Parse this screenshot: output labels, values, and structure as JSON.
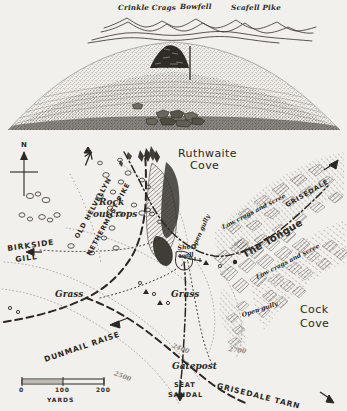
{
  "sheet": {
    "kind": "hand-drawn-fell-map-page",
    "paper_color": "#f2f0ec",
    "ink_color": "#2b2824",
    "contour_ink": "#9b978f"
  },
  "panorama": {
    "caption_row": [
      "Crinkle Crags",
      "Bowfell",
      "Scafell Pike"
    ],
    "summits": [
      {
        "label": "Crinkle Crags",
        "x": 123,
        "y": 9
      },
      {
        "label": "Bowfell",
        "x": 181,
        "y": 8
      },
      {
        "label": "Scafell Pike",
        "x": 232,
        "y": 9
      }
    ],
    "features": [
      "cairn",
      "iron-post",
      "stony-summit-slope",
      "distant-skyline"
    ]
  },
  "map": {
    "compass": {
      "label": "N",
      "x": 22,
      "y": 148
    },
    "scale_bar": {
      "ticks": [
        "0",
        "100",
        "200"
      ],
      "unit": "YARDS",
      "x": 22,
      "y": 378,
      "width": 82
    },
    "places": [
      {
        "name": "Ruthwaite Cove",
        "line1": "Ruthwaite",
        "line2": "Cove",
        "x": 180,
        "y": 148,
        "style": "place-big"
      },
      {
        "name": "Cock Cove",
        "line1": "Cock",
        "line2": "Cove",
        "x": 300,
        "y": 306,
        "style": "place-big"
      },
      {
        "name": "Rock outcrops",
        "line1": "Rock",
        "line2": "outcrops",
        "x": 98,
        "y": 199,
        "style": "place-mid"
      },
      {
        "name": "Grass left",
        "line1": "Grass",
        "x": 57,
        "y": 292,
        "style": "place-mid"
      },
      {
        "name": "Grass right",
        "line1": "Grass",
        "x": 172,
        "y": 292,
        "style": "place-mid"
      },
      {
        "name": "Gatepost",
        "line1": "Gatepost",
        "x": 175,
        "y": 364,
        "style": "place-mid"
      }
    ],
    "annotations": [
      {
        "name": "open-gully-upper",
        "label": "Open gully",
        "x": 197,
        "y": 232,
        "rot": "rot-gully1"
      },
      {
        "name": "open-gully-lower",
        "label": "Open gully",
        "x": 243,
        "y": 308,
        "rot": "rot-gully2"
      },
      {
        "name": "low-crags-scree-upper",
        "label": "Low crags and scree",
        "x": 225,
        "y": 219,
        "rot": "rot-lcs1"
      },
      {
        "name": "low-crags-scree-lower",
        "label": "Low crags and scree",
        "x": 258,
        "y": 268,
        "rot": "rot-lcs2"
      },
      {
        "name": "short-wall",
        "label": "Short wall",
        "line1": "Short",
        "line2": "wall",
        "x": 178,
        "y": 247
      }
    ],
    "routes": [
      {
        "name": "old-helvellyn",
        "label": "OLD HELVELLYN",
        "x": 79,
        "y": 230,
        "rot": "rot-n1",
        "arrow": "up-right"
      },
      {
        "name": "nethermost-pike",
        "label": "NETHERMOST PIKE",
        "x": 92,
        "y": 243,
        "rot": "rot-n2",
        "arrow": "up-right"
      },
      {
        "name": "the-tongue",
        "label": "The Tongue",
        "x": 248,
        "y": 243,
        "rot": "rot-tongue"
      },
      {
        "name": "grisedale",
        "label": "GRISEDALE",
        "x": 289,
        "y": 198,
        "rot": "rot-grisedale",
        "arrow": "up-right"
      },
      {
        "name": "birkside-gill",
        "label": "BIRKSIDE GILL",
        "line1": "BIRKSIDE",
        "line2": "GILL",
        "x": 10,
        "y": 243,
        "arrow": "left"
      },
      {
        "name": "dunmail-raise",
        "label": "DUNMAIL RAISE",
        "x": 48,
        "y": 350,
        "rot": "rot-dunmail",
        "arrow": "left"
      },
      {
        "name": "grisedale-tarn",
        "label": "GRISEDALE TARN",
        "x": 218,
        "y": 378,
        "rot": "rot-gtarn",
        "arrow": "down-right"
      },
      {
        "name": "seat-sandal",
        "label": "SEAT SANDAL",
        "line1": "SEAT",
        "line2": "SANDAL",
        "x": 173,
        "y": 386,
        "arrow": "down"
      }
    ],
    "contours": [
      {
        "label": "2400",
        "x": 172,
        "y": 339,
        "rot": "rot-2400"
      },
      {
        "label": "2500",
        "x": 114,
        "y": 367,
        "rot": "rot-2500"
      },
      {
        "label": "2700",
        "x": 229,
        "y": 343,
        "rot": "rot-2700"
      }
    ]
  }
}
